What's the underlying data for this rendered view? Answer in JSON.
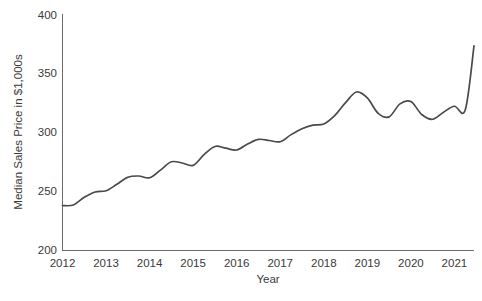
{
  "chart_data": {
    "type": "line",
    "title": "",
    "xlabel": "Year",
    "ylabel": "Median Sales Price in $1,000s",
    "xlim": [
      2012.0,
      2021.45
    ],
    "ylim": [
      200,
      400
    ],
    "ytick_labels": [
      "200",
      "250",
      "300",
      "350",
      "400"
    ],
    "yticks": [
      200,
      250,
      300,
      350,
      400
    ],
    "xtick_labels": [
      "2012",
      "2013",
      "2014",
      "2015",
      "2016",
      "2017",
      "2018",
      "2019",
      "2020",
      "2021"
    ],
    "xticks": [
      2012,
      2013,
      2014,
      2015,
      2016,
      2017,
      2018,
      2019,
      2020,
      2021
    ],
    "grid": false,
    "legend": "none",
    "line_color": "#4a4a4a",
    "axis_color": "#6b6b6b",
    "background_color": "#ffffff",
    "series": [
      {
        "name": "Median Sales Price",
        "x": [
          2012.0,
          2012.25,
          2012.5,
          2012.75,
          2013.0,
          2013.25,
          2013.5,
          2013.75,
          2014.0,
          2014.25,
          2014.5,
          2014.75,
          2015.0,
          2015.25,
          2015.5,
          2015.75,
          2016.0,
          2016.25,
          2016.5,
          2016.75,
          2017.0,
          2017.25,
          2017.5,
          2017.75,
          2018.0,
          2018.25,
          2018.5,
          2018.75,
          2019.0,
          2019.25,
          2019.5,
          2019.75,
          2020.0,
          2020.25,
          2020.5,
          2020.75,
          2021.0,
          2021.25,
          2021.45
        ],
        "values": [
          238.0,
          238.5,
          245.0,
          249.5,
          250.5,
          256.0,
          262.0,
          263.0,
          261.5,
          268.0,
          275.0,
          274.0,
          272.0,
          281.0,
          288.0,
          286.5,
          285.0,
          290.0,
          294.0,
          293.0,
          292.0,
          298.0,
          303.0,
          306.0,
          307.0,
          314.0,
          325.0,
          334.0,
          329.0,
          316.0,
          313.0,
          324.0,
          326.0,
          315.0,
          311.0,
          317.0,
          322.0,
          319.0,
          373.0
        ]
      }
    ],
    "annotations": []
  },
  "axis": {
    "y_title": "Median Sales Price in $1,000s",
    "x_title": "Year"
  }
}
